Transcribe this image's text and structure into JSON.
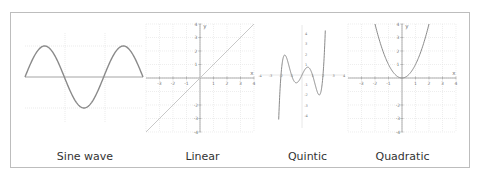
{
  "captions": {
    "sine": "Sine wave",
    "linear": "Linear",
    "quintic": "Quintic",
    "quadratic": "Quadratic"
  },
  "axis_labels": {
    "x": "x",
    "y": "y"
  },
  "colors": {
    "curve": "#8a8a8a",
    "linear_curve": "#c8c8c8",
    "axis": "#9a9a9a",
    "grid": "#e2e2e2",
    "frame": "#bdbdbd",
    "text": "#333333"
  },
  "chart_data": [
    {
      "type": "line",
      "title": "Sine wave",
      "function": "y = sin(x)",
      "x": [
        0,
        1.5708,
        3.1416,
        4.7124,
        6.2832,
        7.854,
        9.4248
      ],
      "values": [
        0,
        1,
        0,
        -1,
        0,
        1,
        0
      ],
      "xlim": [
        0,
        9.4248
      ],
      "ylim": [
        -1.3,
        1.3
      ],
      "grid": true,
      "xlabel": "",
      "ylabel": ""
    },
    {
      "type": "line",
      "title": "Linear",
      "function": "y = x",
      "x": [
        -4,
        -3,
        -2,
        -1,
        0,
        1,
        2,
        3,
        4
      ],
      "values": [
        -4,
        -3,
        -2,
        -1,
        0,
        1,
        2,
        3,
        4
      ],
      "x_ticks": [
        -3,
        -2,
        -1,
        1,
        2,
        3,
        4
      ],
      "y_ticks": [
        -4,
        -3,
        -2,
        1,
        2,
        3,
        4
      ],
      "xlim": [
        -4,
        4
      ],
      "ylim": [
        -4,
        4
      ],
      "grid": true,
      "xlabel": "x",
      "ylabel": "y"
    },
    {
      "type": "line",
      "title": "Quintic",
      "function": "y = x(x^2-1)(x^2-4) (approx.)",
      "x": [
        -2.2,
        -2,
        -1.64,
        -1,
        -0.54,
        0,
        0.54,
        1,
        1.64,
        2,
        2.2
      ],
      "values": [
        -7.4,
        0,
        3.6,
        0,
        -1.4,
        0,
        1.4,
        0,
        -3.6,
        0,
        7.4
      ],
      "x_ticks": [
        -4,
        -3,
        -2,
        -1,
        1,
        2,
        3,
        4
      ],
      "y_ticks": [
        -4,
        -3,
        -2,
        -1,
        1,
        2,
        3,
        4
      ],
      "grid": false,
      "xlabel": "",
      "ylabel": ""
    },
    {
      "type": "line",
      "title": "Quadratic",
      "function": "y = x^2",
      "x": [
        -2,
        -1.5,
        -1,
        -0.5,
        0,
        0.5,
        1,
        1.5,
        2
      ],
      "values": [
        4,
        2.25,
        1,
        0.25,
        0,
        0.25,
        1,
        2.25,
        4
      ],
      "x_ticks": [
        -3,
        -2,
        -1,
        1,
        2,
        3,
        4
      ],
      "y_ticks": [
        -4,
        -3,
        -2,
        1,
        2,
        3,
        4
      ],
      "xlim": [
        -4,
        4
      ],
      "ylim": [
        -4,
        4
      ],
      "grid": true,
      "xlabel": "x",
      "ylabel": "y"
    }
  ]
}
